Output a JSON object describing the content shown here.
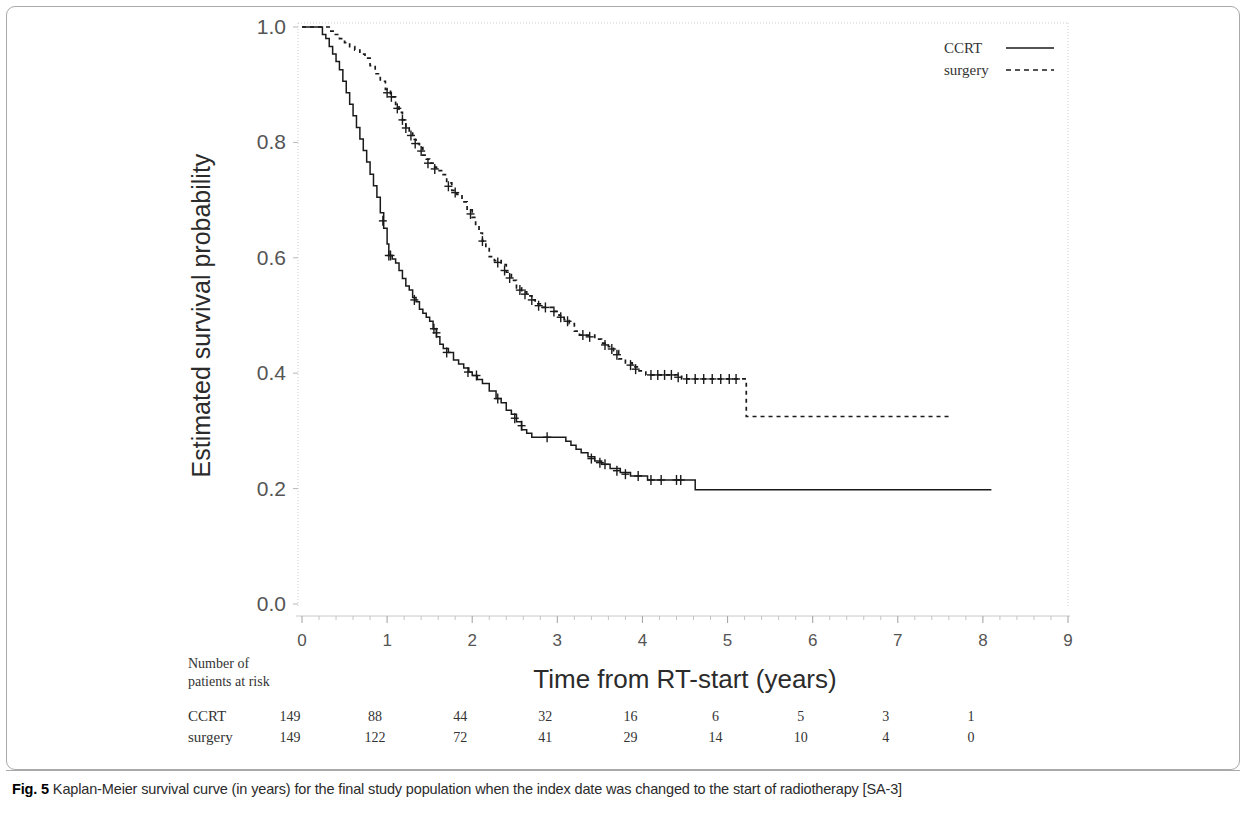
{
  "figure": {
    "caption_label": "Fig. 5",
    "caption_text": "Kaplan-Meier survival curve (in years) for the final study population when the index date was changed to the start of radiotherapy [SA-3]"
  },
  "risk_table": {
    "heading_line1": "Number of",
    "heading_line2": "patients at risk",
    "rows": [
      {
        "label": "CCRT",
        "values": [
          "149",
          "88",
          "44",
          "32",
          "16",
          "6",
          "5",
          "3",
          "1"
        ]
      },
      {
        "label": "surgery",
        "values": [
          "149",
          "122",
          "72",
          "41",
          "29",
          "14",
          "10",
          "4",
          "0"
        ]
      }
    ]
  },
  "chart_data": {
    "type": "line",
    "title": "",
    "xlabel": "Time from RT-start (years)",
    "ylabel": "Estimated survival probability",
    "xlim": [
      0,
      9
    ],
    "ylim": [
      0.0,
      1.0
    ],
    "xticks": [
      0,
      1,
      2,
      3,
      4,
      5,
      6,
      7,
      8,
      9
    ],
    "xtick_labels": [
      "0",
      "1",
      "2",
      "3",
      "4",
      "5",
      "6",
      "7",
      "8",
      "9"
    ],
    "yticks": [
      0.0,
      0.2,
      0.4,
      0.6,
      0.8,
      1.0
    ],
    "ytick_labels": [
      "0.0",
      "0.2",
      "0.4",
      "0.6",
      "0.8",
      "1.0"
    ],
    "minor_xticks_per_interval": 4,
    "grid": false,
    "legend_position": "top-right",
    "legend": [
      {
        "name": "CCRT",
        "style": "solid"
      },
      {
        "name": "surgery",
        "style": "dashed"
      }
    ],
    "series": [
      {
        "name": "CCRT",
        "style": "solid",
        "color": "#1a1a1a",
        "points": [
          [
            0.0,
            1.0
          ],
          [
            0.22,
            1.0
          ],
          [
            0.24,
            0.987
          ],
          [
            0.28,
            0.98
          ],
          [
            0.32,
            0.966
          ],
          [
            0.36,
            0.953
          ],
          [
            0.4,
            0.94
          ],
          [
            0.44,
            0.926
          ],
          [
            0.48,
            0.906
          ],
          [
            0.52,
            0.886
          ],
          [
            0.56,
            0.866
          ],
          [
            0.6,
            0.846
          ],
          [
            0.64,
            0.826
          ],
          [
            0.68,
            0.806
          ],
          [
            0.72,
            0.786
          ],
          [
            0.76,
            0.766
          ],
          [
            0.8,
            0.745
          ],
          [
            0.84,
            0.725
          ],
          [
            0.88,
            0.705
          ],
          [
            0.92,
            0.678
          ],
          [
            0.96,
            0.651
          ],
          [
            1.0,
            0.624
          ],
          [
            1.02,
            0.604
          ],
          [
            1.06,
            0.598
          ],
          [
            1.1,
            0.591
          ],
          [
            1.14,
            0.578
          ],
          [
            1.18,
            0.564
          ],
          [
            1.22,
            0.551
          ],
          [
            1.26,
            0.544
          ],
          [
            1.3,
            0.531
          ],
          [
            1.34,
            0.524
          ],
          [
            1.38,
            0.511
          ],
          [
            1.42,
            0.504
          ],
          [
            1.46,
            0.497
          ],
          [
            1.5,
            0.49
          ],
          [
            1.54,
            0.477
          ],
          [
            1.58,
            0.463
          ],
          [
            1.62,
            0.45
          ],
          [
            1.66,
            0.443
          ],
          [
            1.72,
            0.436
          ],
          [
            1.78,
            0.423
          ],
          [
            1.84,
            0.416
          ],
          [
            1.9,
            0.409
          ],
          [
            1.96,
            0.402
          ],
          [
            2.0,
            0.396
          ],
          [
            2.06,
            0.389
          ],
          [
            2.12,
            0.382
          ],
          [
            2.2,
            0.369
          ],
          [
            2.28,
            0.356
          ],
          [
            2.34,
            0.349
          ],
          [
            2.4,
            0.336
          ],
          [
            2.46,
            0.329
          ],
          [
            2.52,
            0.316
          ],
          [
            2.58,
            0.302
          ],
          [
            2.64,
            0.296
          ],
          [
            2.7,
            0.289
          ],
          [
            3.05,
            0.289
          ],
          [
            3.1,
            0.282
          ],
          [
            3.16,
            0.275
          ],
          [
            3.22,
            0.268
          ],
          [
            3.28,
            0.262
          ],
          [
            3.36,
            0.255
          ],
          [
            3.44,
            0.248
          ],
          [
            3.52,
            0.242
          ],
          [
            3.62,
            0.235
          ],
          [
            3.74,
            0.228
          ],
          [
            3.86,
            0.222
          ],
          [
            4.06,
            0.215
          ],
          [
            4.6,
            0.215
          ],
          [
            4.62,
            0.198
          ],
          [
            8.1,
            0.198
          ]
        ],
        "censor_marks": [
          [
            0.95,
            0.664
          ],
          [
            1.02,
            0.604
          ],
          [
            1.04,
            0.604
          ],
          [
            1.32,
            0.527
          ],
          [
            1.55,
            0.477
          ],
          [
            1.58,
            0.47
          ],
          [
            1.7,
            0.436
          ],
          [
            1.95,
            0.402
          ],
          [
            2.05,
            0.396
          ],
          [
            2.3,
            0.356
          ],
          [
            2.5,
            0.322
          ],
          [
            2.58,
            0.309
          ],
          [
            2.88,
            0.289
          ],
          [
            3.4,
            0.252
          ],
          [
            3.5,
            0.245
          ],
          [
            3.56,
            0.242
          ],
          [
            3.7,
            0.231
          ],
          [
            3.8,
            0.225
          ],
          [
            3.95,
            0.222
          ],
          [
            4.1,
            0.215
          ],
          [
            4.22,
            0.215
          ],
          [
            4.4,
            0.215
          ],
          [
            4.45,
            0.215
          ]
        ]
      },
      {
        "name": "surgery",
        "style": "dashed",
        "color": "#1a1a1a",
        "points": [
          [
            0.0,
            1.0
          ],
          [
            0.28,
            1.0
          ],
          [
            0.32,
            0.993
          ],
          [
            0.38,
            0.987
          ],
          [
            0.44,
            0.98
          ],
          [
            0.5,
            0.973
          ],
          [
            0.56,
            0.966
          ],
          [
            0.62,
            0.96
          ],
          [
            0.68,
            0.953
          ],
          [
            0.74,
            0.946
          ],
          [
            0.8,
            0.933
          ],
          [
            0.86,
            0.919
          ],
          [
            0.92,
            0.906
          ],
          [
            0.98,
            0.892
          ],
          [
            1.04,
            0.879
          ],
          [
            1.1,
            0.866
          ],
          [
            1.14,
            0.852
          ],
          [
            1.18,
            0.839
          ],
          [
            1.22,
            0.825
          ],
          [
            1.26,
            0.818
          ],
          [
            1.3,
            0.805
          ],
          [
            1.34,
            0.798
          ],
          [
            1.38,
            0.791
          ],
          [
            1.42,
            0.778
          ],
          [
            1.46,
            0.771
          ],
          [
            1.5,
            0.764
          ],
          [
            1.54,
            0.757
          ],
          [
            1.58,
            0.751
          ],
          [
            1.64,
            0.744
          ],
          [
            1.7,
            0.73
          ],
          [
            1.76,
            0.717
          ],
          [
            1.82,
            0.71
          ],
          [
            1.88,
            0.697
          ],
          [
            1.94,
            0.683
          ],
          [
            2.0,
            0.67
          ],
          [
            2.04,
            0.656
          ],
          [
            2.08,
            0.643
          ],
          [
            2.12,
            0.629
          ],
          [
            2.16,
            0.616
          ],
          [
            2.2,
            0.602
          ],
          [
            2.26,
            0.595
          ],
          [
            2.34,
            0.588
          ],
          [
            2.4,
            0.575
          ],
          [
            2.46,
            0.561
          ],
          [
            2.52,
            0.548
          ],
          [
            2.58,
            0.541
          ],
          [
            2.64,
            0.534
          ],
          [
            2.7,
            0.527
          ],
          [
            2.74,
            0.52
          ],
          [
            2.8,
            0.514
          ],
          [
            2.9,
            0.514
          ],
          [
            2.96,
            0.507
          ],
          [
            3.02,
            0.5
          ],
          [
            3.08,
            0.493
          ],
          [
            3.14,
            0.486
          ],
          [
            3.2,
            0.473
          ],
          [
            3.26,
            0.466
          ],
          [
            3.34,
            0.466
          ],
          [
            3.44,
            0.459
          ],
          [
            3.52,
            0.452
          ],
          [
            3.6,
            0.446
          ],
          [
            3.66,
            0.439
          ],
          [
            3.72,
            0.425
          ],
          [
            3.8,
            0.418
          ],
          [
            3.88,
            0.411
          ],
          [
            3.96,
            0.404
          ],
          [
            4.04,
            0.397
          ],
          [
            4.4,
            0.397
          ],
          [
            4.46,
            0.39
          ],
          [
            4.6,
            0.39
          ],
          [
            5.18,
            0.39
          ],
          [
            5.22,
            0.325
          ],
          [
            7.62,
            0.325
          ]
        ],
        "censor_marks": [
          [
            1.0,
            0.886
          ],
          [
            1.05,
            0.879
          ],
          [
            1.12,
            0.859
          ],
          [
            1.18,
            0.839
          ],
          [
            1.22,
            0.825
          ],
          [
            1.28,
            0.812
          ],
          [
            1.33,
            0.798
          ],
          [
            1.4,
            0.785
          ],
          [
            1.48,
            0.764
          ],
          [
            1.56,
            0.754
          ],
          [
            1.72,
            0.724
          ],
          [
            1.8,
            0.713
          ],
          [
            1.98,
            0.676
          ],
          [
            2.12,
            0.629
          ],
          [
            2.3,
            0.592
          ],
          [
            2.38,
            0.578
          ],
          [
            2.44,
            0.565
          ],
          [
            2.56,
            0.544
          ],
          [
            2.62,
            0.537
          ],
          [
            2.7,
            0.527
          ],
          [
            2.78,
            0.517
          ],
          [
            2.86,
            0.514
          ],
          [
            2.96,
            0.507
          ],
          [
            3.04,
            0.497
          ],
          [
            3.12,
            0.49
          ],
          [
            3.3,
            0.466
          ],
          [
            3.38,
            0.463
          ],
          [
            3.56,
            0.449
          ],
          [
            3.64,
            0.442
          ],
          [
            3.7,
            0.432
          ],
          [
            3.86,
            0.414
          ],
          [
            3.92,
            0.407
          ],
          [
            4.1,
            0.397
          ],
          [
            4.18,
            0.397
          ],
          [
            4.26,
            0.397
          ],
          [
            4.34,
            0.397
          ],
          [
            4.42,
            0.393
          ],
          [
            4.52,
            0.39
          ],
          [
            4.62,
            0.39
          ],
          [
            4.72,
            0.39
          ],
          [
            4.82,
            0.39
          ],
          [
            4.92,
            0.39
          ],
          [
            5.02,
            0.39
          ],
          [
            5.1,
            0.39
          ]
        ]
      }
    ]
  }
}
